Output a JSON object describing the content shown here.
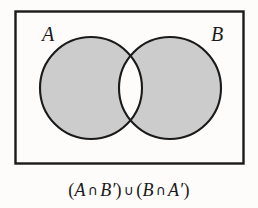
{
  "figure": {
    "type": "venn-diagram",
    "set_labels": {
      "left": "A",
      "right": "B"
    },
    "caption": {
      "full_text": "(A ∩ B′) ∪ (B ∩ A′)",
      "open_paren_1": "(",
      "left_set": "A",
      "intersect_1": "∩",
      "right_set_complement": "B",
      "prime_1": "′",
      "close_paren_1": ")",
      "union": "∪",
      "open_paren_2": "(",
      "right_set": "B",
      "intersect_2": "∩",
      "left_set_complement": "A",
      "prime_2": "′",
      "close_paren_2": ")"
    },
    "shaded_region_description": "symmetric difference",
    "colors": {
      "background": "#fdfcfa",
      "shading": "#cccccc",
      "outline": "#1a1a1a",
      "text": "#1a1a1a",
      "unshaded_overlap": "#fdfcfa"
    },
    "geometry": {
      "rect": {
        "x": 15,
        "y": 11,
        "width": 229,
        "height": 153
      },
      "circle_left": {
        "cx": 91,
        "cy": 88,
        "r": 51
      },
      "circle_right": {
        "cx": 170,
        "cy": 88,
        "r": 51
      },
      "label_left_pos": {
        "x": 42,
        "y": 34
      },
      "label_right_pos": {
        "x": 213,
        "y": 34
      }
    }
  }
}
